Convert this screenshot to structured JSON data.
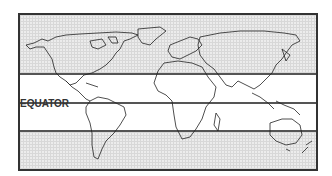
{
  "map": {
    "title": "World map with tropics",
    "labels": {
      "equator": "EQUATOR"
    },
    "lines": [
      {
        "name": "tropic-of-cancer",
        "y": 73
      },
      {
        "name": "equator",
        "y": 102
      },
      {
        "name": "tropic-of-capricorn",
        "y": 130
      }
    ],
    "colors": {
      "frame": "#333333",
      "outside_tropics": "#ececec",
      "tropics": "#ffffff",
      "lines": "#555555",
      "coastline": "#222222"
    }
  }
}
